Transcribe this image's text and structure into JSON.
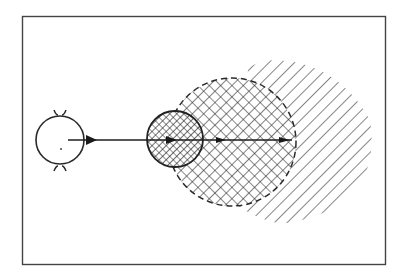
{
  "figure": {
    "background": "#ffffff",
    "ink": "#2a2a2a",
    "frame": {
      "x": 22,
      "y": 16,
      "width": 363,
      "height": 248
    },
    "source": {
      "label": "",
      "center": [
        60,
        140
      ],
      "radius": 24,
      "dot": [
        61,
        149
      ]
    },
    "beam": {
      "from": [
        68,
        140
      ],
      "to": [
        292,
        140
      ]
    },
    "small_target": {
      "center": [
        175,
        139
      ],
      "radius": 28,
      "hatch": "cross-dense"
    },
    "large_region": {
      "center": [
        232,
        142
      ],
      "radius": 64,
      "border": "dashed",
      "hatch": "cross"
    },
    "outer_region": {
      "hatch": "diagonal-single",
      "extent_right": 372
    },
    "arrowheads": [
      {
        "x": 93,
        "y": 140
      },
      {
        "x": 172,
        "y": 140
      },
      {
        "x": 222,
        "y": 140
      },
      {
        "x": 285,
        "y": 140
      }
    ]
  }
}
